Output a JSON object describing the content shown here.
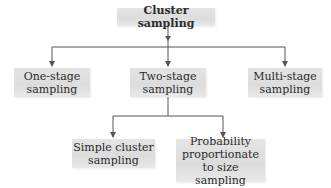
{
  "diagram": {
    "type": "hierarchy",
    "root": {
      "label": "Cluster sampling"
    },
    "level1": [
      {
        "label": "One-stage\nsampling"
      },
      {
        "label": "Two-stage\nsampling"
      },
      {
        "label": "Multi-stage\nsampling"
      }
    ],
    "level2": [
      {
        "label": "Simple cluster\nsampling",
        "parent": "Two-stage sampling"
      },
      {
        "label": "Probability\nproportionate\nto size sampling",
        "parent": "Two-stage sampling"
      }
    ],
    "colors": {
      "box_fill": "#e0e0e0",
      "line": "#555555",
      "text": "#2a2a2a",
      "background": "#ffffff"
    }
  }
}
